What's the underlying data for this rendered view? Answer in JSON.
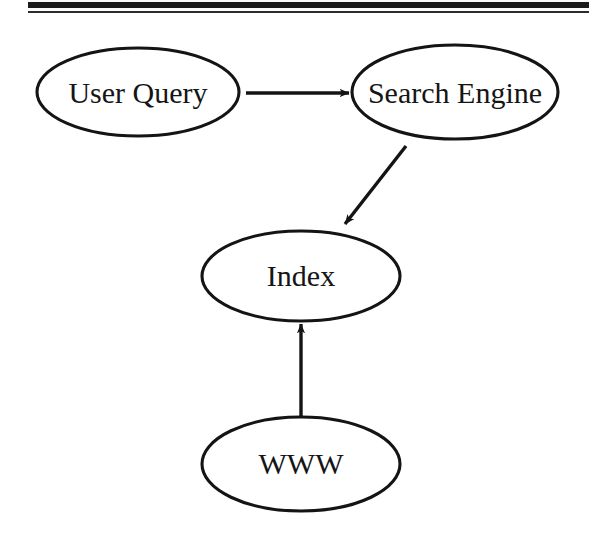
{
  "page": {
    "background_color": "#ffffff",
    "ink_color": "#1a1a1a",
    "width": 589,
    "height": 534
  },
  "header_rules": {
    "thick_rule_color": "#1c1c1c",
    "thin_rule_color": "#2b2b2b"
  },
  "diagram": {
    "type": "flowchart",
    "title": "",
    "nodes": [
      {
        "id": "user-query",
        "label": "User Query",
        "shape": "ellipse",
        "cx": 138,
        "cy": 92,
        "rx": 101,
        "ry": 44
      },
      {
        "id": "search-engine",
        "label": "Search Engine",
        "shape": "ellipse",
        "cx": 455,
        "cy": 92,
        "rx": 103,
        "ry": 47
      },
      {
        "id": "index",
        "label": "Index",
        "shape": "ellipse",
        "cx": 301,
        "cy": 276,
        "rx": 99,
        "ry": 45
      },
      {
        "id": "www",
        "label": "WWW",
        "shape": "ellipse",
        "cx": 301,
        "cy": 464,
        "rx": 99,
        "ry": 47
      }
    ],
    "edges": [
      {
        "id": "edge-user-query-to-search-engine",
        "from": "user-query",
        "to": "search-engine",
        "label": "",
        "direction": "right",
        "x1": 246,
        "y1": 93,
        "x2": 350,
        "y2": 93
      },
      {
        "id": "edge-search-engine-to-index",
        "from": "search-engine",
        "to": "index",
        "label": "",
        "direction": "down-left",
        "x1": 406,
        "y1": 146,
        "x2": 343,
        "y2": 226
      },
      {
        "id": "edge-www-to-index",
        "from": "www",
        "to": "index",
        "label": "",
        "direction": "up",
        "x1": 301,
        "y1": 416,
        "x2": 301,
        "y2": 322
      }
    ]
  }
}
